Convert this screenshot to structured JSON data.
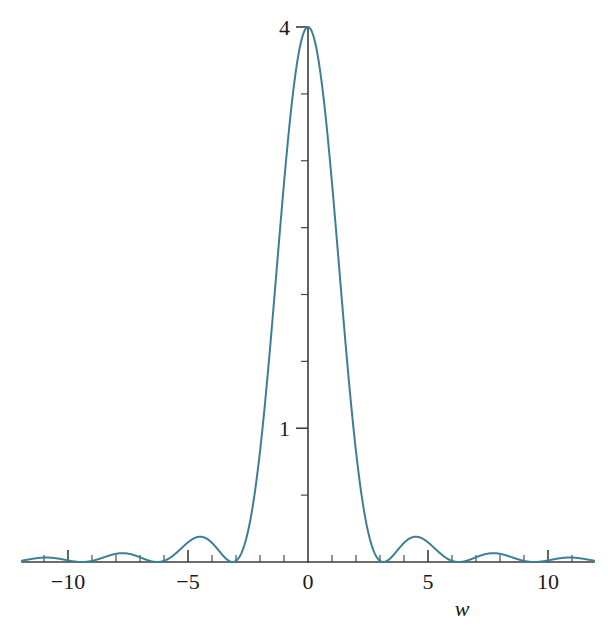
{
  "chart_data": {
    "type": "line",
    "title": "",
    "subtitle": "",
    "xlabel": "w",
    "ylabel": "",
    "grid": false,
    "legend": null,
    "function": "4*(sin(w)/w)^2",
    "xlim": [
      -11.92,
      11.92
    ],
    "ylim": [
      0,
      4.0
    ],
    "x_ticks_major": [
      -10,
      -5,
      0,
      5,
      10
    ],
    "x_tick_labels": [
      "−10",
      "−5",
      "0",
      "5",
      "10"
    ],
    "x_ticks_minor": [
      -11,
      -9,
      -8,
      -7,
      -6,
      -4,
      -3,
      -2,
      -1,
      1,
      2,
      3,
      4,
      6,
      7,
      8,
      9,
      11
    ],
    "y_ticks_major": [
      1,
      4
    ],
    "y_tick_labels": [
      "1",
      "4"
    ],
    "y_ticks_minor": [
      0.5,
      1.5,
      2.0,
      2.5,
      3.0,
      3.5
    ],
    "series": [
      {
        "name": "4 sinc^2(w)",
        "color": "#3b7f96",
        "peak_value": 4.0,
        "peak_x": 0,
        "zeros": [
          -11.0,
          -9.42,
          -7.85,
          -6.28,
          -4.71,
          -3.14,
          -1.57,
          1.57,
          3.14,
          4.71,
          6.28,
          7.85,
          9.42,
          11.0
        ],
        "lobe_peaks_x": [
          -10.21,
          -8.64,
          -7.07,
          -5.5,
          -3.93,
          -2.36,
          0,
          2.36,
          3.93,
          5.5,
          7.07,
          8.64,
          10.21
        ],
        "lobe_peaks_y": [
          0.042,
          0.057,
          0.085,
          0.14,
          0.28,
          0.77,
          4.0,
          0.77,
          0.28,
          0.14,
          0.085,
          0.057,
          0.042
        ]
      }
    ],
    "colors": {
      "curve": "#3b7f96",
      "axis": "#3c3c3c",
      "text": "#1a1a1a",
      "background": "#ffffff"
    }
  }
}
